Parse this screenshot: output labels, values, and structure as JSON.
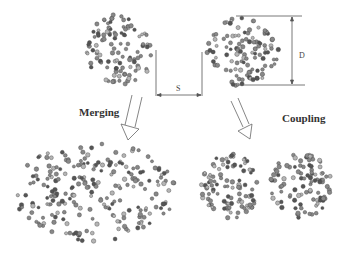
{
  "diagram": {
    "labels": {
      "merging": "Merging",
      "coupling": "Coupling",
      "separation": "S",
      "diameter": "D"
    },
    "clusters": [
      {
        "id": "top-left",
        "shape": "circle",
        "cx": 120,
        "cy": 50,
        "rx": 34,
        "ry": 36,
        "count": 110
      },
      {
        "id": "top-right",
        "shape": "circle",
        "cx": 243,
        "cy": 52,
        "rx": 36,
        "ry": 36,
        "count": 110
      },
      {
        "id": "bottom-left-merged",
        "shape": "ellipse",
        "cx": 95,
        "cy": 192,
        "rx": 82,
        "ry": 50,
        "count": 230
      },
      {
        "id": "bottom-right-coupled-a",
        "shape": "circle",
        "cx": 231,
        "cy": 187,
        "rx": 30,
        "ry": 33,
        "count": 100
      },
      {
        "id": "bottom-right-coupled-b",
        "shape": "circle",
        "cx": 300,
        "cy": 185,
        "rx": 32,
        "ry": 33,
        "count": 100
      }
    ],
    "colors": {
      "particle_dark": "#555555",
      "particle_mid": "#888888",
      "particle_light": "#b5b5b5",
      "line": "#555555",
      "text": "#333333"
    }
  }
}
